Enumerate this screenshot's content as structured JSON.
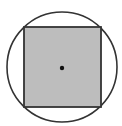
{
  "diagram": {
    "circle": {
      "cx": 62,
      "cy": 67,
      "r": 55,
      "stroke": "#333333",
      "fill": "#ffffff"
    },
    "square": {
      "x": 24,
      "y": 27,
      "width": 77,
      "height": 80,
      "stroke": "#333333",
      "fill": "#bdbdbd"
    },
    "center_point": {
      "cx": 62,
      "cy": 68,
      "r": 2.2,
      "fill": "#111111"
    }
  }
}
